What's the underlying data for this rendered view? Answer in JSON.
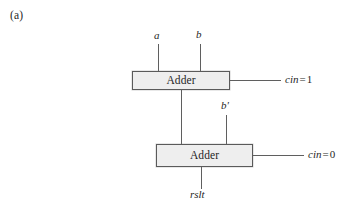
{
  "figure": {
    "part_label": "(a)",
    "blocks": [
      {
        "id": "adder-top",
        "label": "Adder"
      },
      {
        "id": "adder-bottom",
        "label": "Adder"
      }
    ],
    "signals": {
      "input_a": "a",
      "input_b": "b",
      "input_b_prime": "b'",
      "output_rslt": "rslt"
    },
    "carry_inputs": [
      {
        "name": "cin",
        "equals": "=",
        "value": "1",
        "full": "cin = 1"
      },
      {
        "name": "cin",
        "equals": "=",
        "value": "0",
        "full": "cin = 0"
      }
    ],
    "colors": {
      "block_fill": "#eeeeee",
      "block_border": "#5a5a5a",
      "wire": "#5f5f5f",
      "text": "#1f1f1f",
      "background": "#ffffff"
    }
  }
}
